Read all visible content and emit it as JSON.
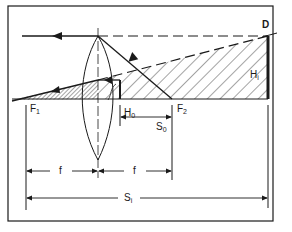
{
  "diagram": {
    "title": "",
    "colors": {
      "ink": "#1a1a1a",
      "background": "#ffffff"
    },
    "labels": {
      "D": {
        "main": "D",
        "sub": ""
      },
      "F1": {
        "main": "F",
        "sub": "1"
      },
      "F2": {
        "main": "F",
        "sub": "2"
      },
      "H0": {
        "main": "H",
        "sub": "0"
      },
      "Hi": {
        "main": "H",
        "sub": "i"
      },
      "S0": {
        "main": "S",
        "sub": "0"
      },
      "Si": {
        "main": "S",
        "sub": "i"
      },
      "f_left": "f",
      "f_right": "f"
    },
    "elements": [
      "convex-lens",
      "optical-axis",
      "object-arrow",
      "image-bar",
      "parallel-ray",
      "focal-ray",
      "chief-ray",
      "hatched-object-region",
      "hatched-image-region",
      "dimension-f-left",
      "dimension-f-right",
      "dimension-s0",
      "dimension-si"
    ]
  }
}
